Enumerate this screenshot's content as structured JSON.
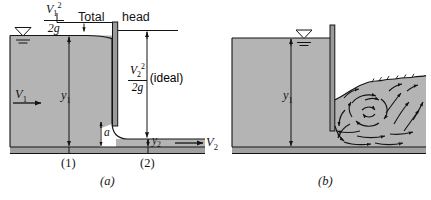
{
  "figure": {
    "panels": [
      {
        "caption": "(a)",
        "description": "ideal flow with energy head diagram"
      },
      {
        "caption": "(b)",
        "description": "real flow with turbulent recirculation"
      }
    ]
  },
  "panel_a": {
    "caption": "(a)",
    "velocity_head_1": {
      "numerator": "V",
      "num_sub": "1",
      "num_sup": "2",
      "denominator": "2g"
    },
    "total_head_label": "Total",
    "head_label": "head",
    "velocity_head_2": {
      "numerator": "V",
      "num_sub": "2",
      "num_sup": "2",
      "denominator": "2g"
    },
    "ideal_label": "(ideal)",
    "inlet_velocity": {
      "symbol": "V",
      "sub": "1"
    },
    "outlet_velocity": {
      "symbol": "V",
      "sub": "2"
    },
    "depth_upstream": {
      "symbol": "y",
      "sub": "1"
    },
    "depth_downstream": {
      "symbol": "y",
      "sub": "2"
    },
    "gate_opening": "a",
    "station_1": "(1)",
    "station_2": "(2)"
  },
  "panel_b": {
    "caption": "(b)",
    "depth_upstream": {
      "symbol": "y",
      "sub": "1"
    }
  },
  "colors": {
    "water_fill": "#b4b4b4",
    "ground_band": "#a0a0a0",
    "gate_fill": "#9a9a9a",
    "line": "#141414",
    "background": "#ffffff"
  }
}
